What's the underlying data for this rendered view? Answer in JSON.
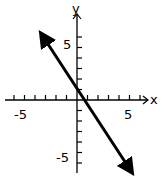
{
  "chart_data": {
    "type": "line",
    "title": "",
    "xlabel": "x",
    "ylabel": "y",
    "xlim": [
      -7,
      7
    ],
    "ylim": [
      -7,
      7
    ],
    "grid": false,
    "x_tick_labels": [
      "-5",
      "5"
    ],
    "y_tick_labels": [
      "5",
      "-5"
    ],
    "tick_step": 1,
    "series": [
      {
        "name": "line",
        "equation": "y = -1.5x + 1",
        "slope": -1.5,
        "intercept": 1,
        "x": [
          -3.7,
          5.4
        ],
        "y": [
          6.6,
          -7.1
        ],
        "arrows": "both"
      }
    ]
  },
  "labels": {
    "x_axis": "x",
    "y_axis": "y",
    "x_neg": "-5",
    "x_pos": "5",
    "y_pos": "5",
    "y_neg": "-5"
  }
}
